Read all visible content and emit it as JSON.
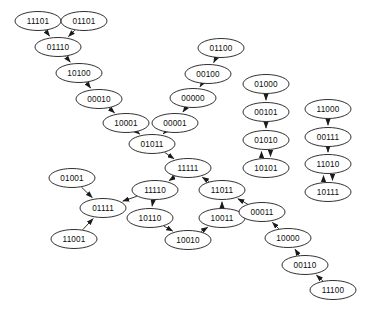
{
  "diagram": {
    "type": "directed-graph",
    "title": "",
    "background_color": "#ffffff",
    "node_shape": "ellipse",
    "node_fill": "#ffffff",
    "node_stroke": "#1a1a1a",
    "edge_color": "#1a1a1a",
    "node_width": 46,
    "node_height": 19,
    "node_count": 32,
    "edge_count": 33,
    "nodes": [
      {
        "id": "11101",
        "label": "11101",
        "x": 38,
        "y": 21
      },
      {
        "id": "01101",
        "label": "01101",
        "x": 84,
        "y": 21
      },
      {
        "id": "01110",
        "label": "01110",
        "x": 58,
        "y": 47
      },
      {
        "id": "10100",
        "label": "10100",
        "x": 79,
        "y": 73
      },
      {
        "id": "00010",
        "label": "00010",
        "x": 99,
        "y": 99
      },
      {
        "id": "10001",
        "label": "10001",
        "x": 126,
        "y": 123
      },
      {
        "id": "01100",
        "label": "01100",
        "x": 221,
        "y": 48
      },
      {
        "id": "00100",
        "label": "00100",
        "x": 208,
        "y": 74
      },
      {
        "id": "00000",
        "label": "00000",
        "x": 193,
        "y": 98
      },
      {
        "id": "00001",
        "label": "00001",
        "x": 175,
        "y": 123
      },
      {
        "id": "01011",
        "label": "01011",
        "x": 152,
        "y": 144
      },
      {
        "id": "11111",
        "label": "11111",
        "x": 188,
        "y": 168
      },
      {
        "id": "01000",
        "label": "01000",
        "x": 266,
        "y": 84
      },
      {
        "id": "00101",
        "label": "00101",
        "x": 266,
        "y": 112
      },
      {
        "id": "01010",
        "label": "01010",
        "x": 266,
        "y": 140
      },
      {
        "id": "10101",
        "label": "10101",
        "x": 266,
        "y": 168
      },
      {
        "id": "11000",
        "label": "11000",
        "x": 328,
        "y": 109
      },
      {
        "id": "00111",
        "label": "00111",
        "x": 328,
        "y": 137
      },
      {
        "id": "11010",
        "label": "11010",
        "x": 328,
        "y": 164
      },
      {
        "id": "10111",
        "label": "10111",
        "x": 328,
        "y": 192
      },
      {
        "id": "01001",
        "label": "01001",
        "x": 72,
        "y": 178
      },
      {
        "id": "01111",
        "label": "01111",
        "x": 103,
        "y": 208
      },
      {
        "id": "11001",
        "label": "11001",
        "x": 74,
        "y": 239
      },
      {
        "id": "11110",
        "label": "11110",
        "x": 155,
        "y": 190
      },
      {
        "id": "10110",
        "label": "10110",
        "x": 150,
        "y": 218
      },
      {
        "id": "10010",
        "label": "10010",
        "x": 188,
        "y": 240
      },
      {
        "id": "10011",
        "label": "10011",
        "x": 222,
        "y": 218
      },
      {
        "id": "11011",
        "label": "11011",
        "x": 222,
        "y": 190
      },
      {
        "id": "00011",
        "label": "00011",
        "x": 262,
        "y": 212
      },
      {
        "id": "10000",
        "label": "10000",
        "x": 288,
        "y": 238
      },
      {
        "id": "00110",
        "label": "00110",
        "x": 305,
        "y": 265
      },
      {
        "id": "11100",
        "label": "11100",
        "x": 333,
        "y": 290
      }
    ],
    "edges": [
      {
        "from": "11101",
        "to": "01110",
        "bidirectional": false
      },
      {
        "from": "01101",
        "to": "01110",
        "bidirectional": false
      },
      {
        "from": "01110",
        "to": "10100",
        "bidirectional": false
      },
      {
        "from": "10100",
        "to": "00010",
        "bidirectional": false
      },
      {
        "from": "00010",
        "to": "10001",
        "bidirectional": false
      },
      {
        "from": "10001",
        "to": "01011",
        "bidirectional": false
      },
      {
        "from": "01100",
        "to": "00100",
        "bidirectional": false
      },
      {
        "from": "00100",
        "to": "00000",
        "bidirectional": false
      },
      {
        "from": "00000",
        "to": "00001",
        "bidirectional": false
      },
      {
        "from": "00001",
        "to": "01011",
        "bidirectional": false
      },
      {
        "from": "01011",
        "to": "11111",
        "bidirectional": false
      },
      {
        "from": "01000",
        "to": "00101",
        "bidirectional": false
      },
      {
        "from": "00101",
        "to": "01010",
        "bidirectional": false
      },
      {
        "from": "01010",
        "to": "10101",
        "bidirectional": true
      },
      {
        "from": "11000",
        "to": "00111",
        "bidirectional": false
      },
      {
        "from": "00111",
        "to": "11010",
        "bidirectional": false
      },
      {
        "from": "11010",
        "to": "10111",
        "bidirectional": true
      },
      {
        "from": "01001",
        "to": "01111",
        "bidirectional": false
      },
      {
        "from": "11001",
        "to": "01111",
        "bidirectional": false
      },
      {
        "from": "11110",
        "to": "01111",
        "bidirectional": false
      },
      {
        "from": "11111",
        "to": "11110",
        "bidirectional": false
      },
      {
        "from": "11110",
        "to": "10110",
        "bidirectional": false
      },
      {
        "from": "10110",
        "to": "10010",
        "bidirectional": false
      },
      {
        "from": "10010",
        "to": "10011",
        "bidirectional": false
      },
      {
        "from": "10011",
        "to": "11011",
        "bidirectional": false
      },
      {
        "from": "11011",
        "to": "11111",
        "bidirectional": false
      },
      {
        "from": "00011",
        "to": "11011",
        "bidirectional": false
      },
      {
        "from": "10000",
        "to": "00011",
        "bidirectional": false
      },
      {
        "from": "00110",
        "to": "10000",
        "bidirectional": false
      },
      {
        "from": "11100",
        "to": "00110",
        "bidirectional": false
      }
    ]
  }
}
